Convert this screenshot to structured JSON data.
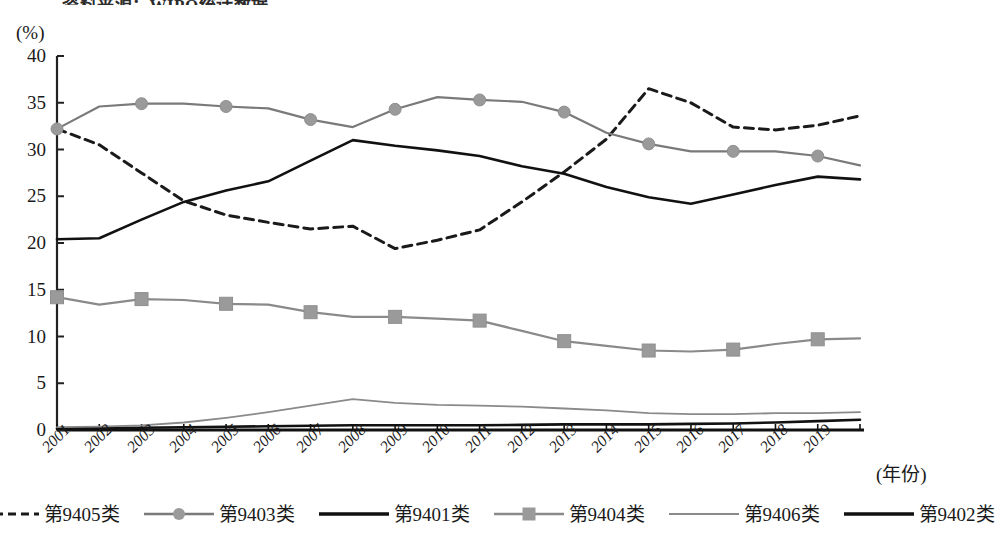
{
  "top_caption": "资料来源：WIPO统计数据。",
  "axis": {
    "y_unit_label": "(%)",
    "x_title": "(年份)",
    "y_ticks": [
      0,
      5,
      10,
      15,
      20,
      25,
      30,
      35,
      40
    ],
    "y_min": 0,
    "y_max": 40
  },
  "chart_data": {
    "type": "line",
    "title": "",
    "xlabel": "(年份)",
    "ylabel": "(%)",
    "ylim": [
      0,
      40
    ],
    "grid": false,
    "legend_position": "bottom",
    "categories": [
      "2001",
      "2002",
      "2003",
      "2004",
      "2005",
      "2006",
      "2007",
      "2008",
      "2009",
      "2010",
      "2011",
      "2012",
      "2013",
      "2014",
      "2015",
      "2016",
      "2017",
      "2018",
      "2019",
      "2020"
    ],
    "x_tick_labels": [
      "2001",
      "2002",
      "2003",
      "2004",
      "2005",
      "2006",
      "2007",
      "2008",
      "2009",
      "2010",
      "2011",
      "2012",
      "2013",
      "2014",
      "2015",
      "2016",
      "2017",
      "2018",
      "2019"
    ],
    "series": [
      {
        "name": "第9405类",
        "style": "dashed",
        "color": "#1a1a1a",
        "marker": "none",
        "values": [
          32.2,
          30.5,
          27.5,
          24.5,
          23.0,
          22.2,
          21.5,
          21.8,
          19.4,
          20.3,
          21.4,
          24.4,
          27.6,
          31.1,
          36.5,
          35.0,
          32.4,
          32.1,
          32.6,
          33.6
        ]
      },
      {
        "name": "第9403类",
        "style": "solid",
        "color": "#7a7a7a",
        "marker": "circle",
        "values": [
          32.2,
          34.6,
          34.9,
          34.9,
          34.6,
          34.4,
          33.2,
          32.4,
          34.3,
          35.6,
          35.3,
          35.1,
          34.0,
          31.8,
          30.6,
          29.8,
          29.8,
          29.8,
          29.3,
          28.3
        ]
      },
      {
        "name": "第9401类",
        "style": "solid",
        "color": "#111111",
        "marker": "none",
        "values": [
          0.15,
          0.2,
          0.25,
          0.3,
          0.35,
          0.4,
          0.45,
          0.5,
          0.5,
          0.5,
          0.5,
          0.55,
          0.6,
          0.6,
          0.6,
          0.65,
          0.7,
          0.8,
          0.95,
          1.1
        ]
      },
      {
        "name": "第9404类",
        "style": "solid",
        "color": "#8a8a8a",
        "marker": "square",
        "values": [
          14.2,
          13.4,
          14.0,
          13.9,
          13.5,
          13.4,
          12.6,
          12.1,
          12.1,
          11.9,
          11.7,
          10.6,
          9.5,
          9.0,
          8.5,
          8.4,
          8.6,
          9.2,
          9.7,
          9.8
        ]
      },
      {
        "name": "第9406类",
        "style": "solid-thin",
        "color": "#8a8a8a",
        "marker": "none",
        "values": [
          0.3,
          0.35,
          0.5,
          0.8,
          1.3,
          1.9,
          2.6,
          3.3,
          2.9,
          2.7,
          2.6,
          2.5,
          2.3,
          2.1,
          1.8,
          1.7,
          1.7,
          1.8,
          1.8,
          1.9
        ]
      },
      {
        "name": "第9402类",
        "style": "solid",
        "color": "#111111",
        "marker": "none",
        "values": [
          20.4,
          20.5,
          22.5,
          24.4,
          25.6,
          26.6,
          28.8,
          31.0,
          30.4,
          29.9,
          29.3,
          28.2,
          27.4,
          26.0,
          24.9,
          24.2,
          25.2,
          26.2,
          27.1,
          26.8
        ]
      }
    ]
  },
  "legend": {
    "items": [
      {
        "label": "第9405类",
        "swatch": "dashed-line-swatch"
      },
      {
        "label": "第9403类",
        "swatch": "gray-circle-line-swatch"
      },
      {
        "label": "第9401类",
        "swatch": "black-line-swatch"
      },
      {
        "label": "第9404类",
        "swatch": "gray-square-line-swatch"
      },
      {
        "label": "第9406类",
        "swatch": "thin-gray-line-swatch"
      },
      {
        "label": "第9402类",
        "swatch": "black-thick-line-swatch"
      }
    ]
  }
}
